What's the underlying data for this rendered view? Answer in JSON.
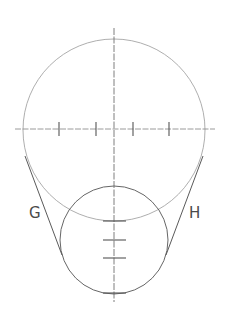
{
  "diagram": {
    "type": "construction-drawing",
    "colors": {
      "background": "#ffffff",
      "light_line": "#9a9a9a",
      "dark_line": "#555555",
      "label": "#4a4a4a"
    },
    "large_circle": {
      "cx": 114,
      "cy": 130,
      "r": 91
    },
    "small_circle": {
      "cx": 114,
      "cy": 240,
      "r": 54
    },
    "vertical_axis": {
      "x": 114,
      "y1": 28,
      "y2": 302
    },
    "horizontal_axis": {
      "y": 129,
      "x1": 15,
      "x2": 215
    },
    "horizontal_axis_ticks_x": [
      59,
      96,
      133,
      169
    ],
    "vertical_axis_ticks_y": [
      221,
      240,
      258,
      293
    ],
    "tangent_lines": [
      {
        "name": "G",
        "x1": 25,
        "y1": 156,
        "x2": 62,
        "y2": 255
      },
      {
        "name": "H",
        "x1": 203,
        "y1": 156,
        "x2": 166,
        "y2": 255
      }
    ],
    "labels": {
      "left": "G",
      "right": "H"
    }
  }
}
